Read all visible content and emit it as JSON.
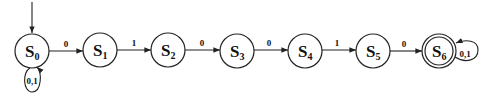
{
  "diagram": {
    "type": "finite-state-automaton",
    "start_state": "S0",
    "accept_states": [
      "S6"
    ],
    "states": [
      {
        "id": "S0",
        "main": "S",
        "sub": "0",
        "cx": 32,
        "cy": 51,
        "accept": false
      },
      {
        "id": "S1",
        "main": "S",
        "sub": "1",
        "cx": 100,
        "cy": 50,
        "accept": false
      },
      {
        "id": "S2",
        "main": "S",
        "sub": "2",
        "cx": 168,
        "cy": 50,
        "accept": false
      },
      {
        "id": "S3",
        "main": "S",
        "sub": "3",
        "cx": 237,
        "cy": 51,
        "accept": false
      },
      {
        "id": "S4",
        "main": "S",
        "sub": "4",
        "cx": 305,
        "cy": 51,
        "accept": false
      },
      {
        "id": "S5",
        "main": "S",
        "sub": "5",
        "cx": 373,
        "cy": 51,
        "accept": false
      },
      {
        "id": "S6",
        "main": "S",
        "sub": "6",
        "cx": 439,
        "cy": 51,
        "accept": true
      }
    ],
    "transitions": [
      {
        "from": "S0",
        "to": "S0",
        "label": "0,1"
      },
      {
        "from": "S0",
        "to": "S1",
        "label": "0"
      },
      {
        "from": "S1",
        "to": "S2",
        "label": "1"
      },
      {
        "from": "S2",
        "to": "S3",
        "label": "0"
      },
      {
        "from": "S3",
        "to": "S4",
        "label": "0"
      },
      {
        "from": "S4",
        "to": "S5",
        "label": "1"
      },
      {
        "from": "S5",
        "to": "S6",
        "label": "0"
      },
      {
        "from": "S6",
        "to": "S6",
        "label": "0,1"
      }
    ]
  }
}
